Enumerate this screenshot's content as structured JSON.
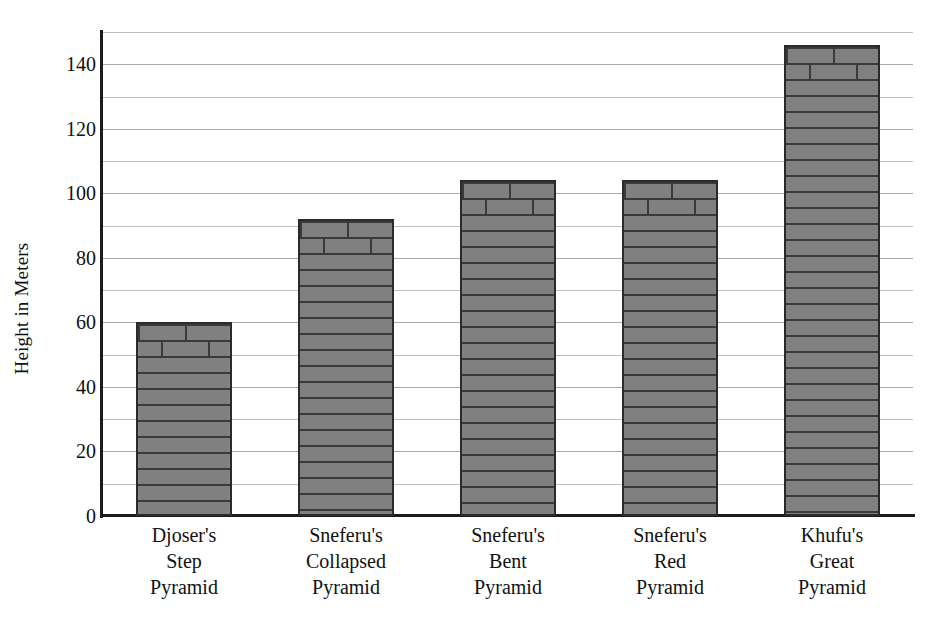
{
  "chart_data": {
    "type": "bar",
    "title": "",
    "xlabel": "",
    "ylabel": "Height in Meters",
    "ylim": [
      0,
      150
    ],
    "ytick_step": 20,
    "gridline_step": 10,
    "grid": true,
    "legend": "none",
    "bar_style": "brick-texture",
    "bar_fill_color": "#808080",
    "bar_edge_color": "#2b2b2b",
    "gridline_color": "#bfbfbf",
    "axis_color": "#1c1c1c",
    "categories": [
      "Djoser's Step Pyramid",
      "Sneferu's Collapsed Pyramid",
      "Sneferu's Bent Pyramid",
      "Sneferu's Red Pyramid",
      "Khufu's Great Pyramid"
    ],
    "values": [
      60,
      92,
      104,
      104,
      146
    ],
    "ytick_labels": [
      "0",
      "20",
      "40",
      "60",
      "80",
      "100",
      "120",
      "140"
    ],
    "ytick_values": [
      0,
      20,
      40,
      60,
      80,
      100,
      120,
      140
    ]
  },
  "axis": {
    "y_title": "Height in Meters"
  },
  "categories_multiline": [
    {
      "line1": "Djoser's",
      "line2": "Step",
      "line3": "Pyramid"
    },
    {
      "line1": "Sneferu's",
      "line2": "Collapsed",
      "line3": "Pyramid"
    },
    {
      "line1": "Sneferu's",
      "line2": "Bent",
      "line3": "Pyramid"
    },
    {
      "line1": "Sneferu's",
      "line2": "Red",
      "line3": "Pyramid"
    },
    {
      "line1": "Khufu's",
      "line2": "Great",
      "line3": "Pyramid"
    }
  ]
}
